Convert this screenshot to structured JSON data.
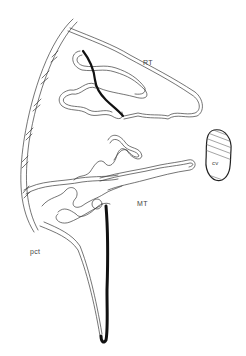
{
  "figure": {
    "type": "anatomical line drawing",
    "labels": {
      "rt": "RT",
      "mt": "MT",
      "pct": "pct",
      "cv": "cv"
    },
    "colors": {
      "line": "#333333",
      "thick_line": "#111111",
      "background": "#ffffff",
      "label": "#444444"
    }
  }
}
